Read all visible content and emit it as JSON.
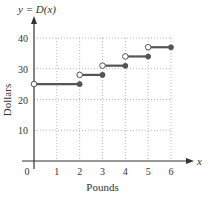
{
  "chart_data": {
    "type": "line",
    "subtype": "step-function",
    "title": "y = D(x)",
    "xlabel": "Pounds",
    "ylabel": "Dollars",
    "x_axis_symbol": "x",
    "xlim": [
      0,
      6
    ],
    "ylim": [
      0,
      40
    ],
    "x_ticks": [
      "0",
      "1",
      "2",
      "3",
      "4",
      "5",
      "6"
    ],
    "y_ticks": [
      "10",
      "20",
      "30",
      "40"
    ],
    "grid": true,
    "grid_style": "dotted",
    "segments": [
      {
        "x_start": 0,
        "x_end": 2,
        "y": 25,
        "start_open": true,
        "end_closed": true
      },
      {
        "x_start": 2,
        "x_end": 3,
        "y": 28,
        "start_open": true,
        "end_closed": true
      },
      {
        "x_start": 3,
        "x_end": 4,
        "y": 31,
        "start_open": true,
        "end_closed": true
      },
      {
        "x_start": 4,
        "x_end": 5,
        "y": 34,
        "start_open": true,
        "end_closed": true
      },
      {
        "x_start": 5,
        "x_end": 6,
        "y": 37,
        "start_open": true,
        "end_closed": true
      }
    ],
    "colors": {
      "line": "#555555",
      "axis": "#333333",
      "grid": "#aaaaaa"
    }
  }
}
